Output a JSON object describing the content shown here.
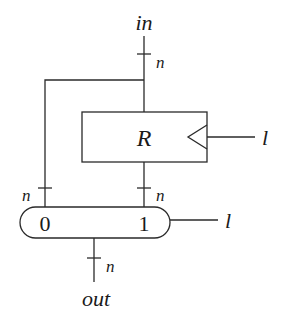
{
  "diagram": {
    "input_label": "in",
    "output_label": "out",
    "register": {
      "label": "R",
      "clock_signal_label": "l"
    },
    "mux": {
      "input0_label": "0",
      "input1_label": "1",
      "select_signal_label": "l"
    },
    "bus_width_labels": {
      "input_bus": "n",
      "bypass_bus": "n",
      "register_output_bus": "n",
      "output_bus": "n"
    },
    "colors": {
      "line": "#2a2a2a",
      "text": "#1a1a1a",
      "background": "#ffffff"
    }
  }
}
